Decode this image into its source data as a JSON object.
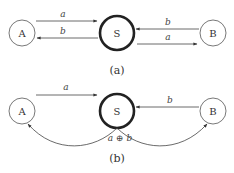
{
  "diagram": {
    "colors": {
      "stroke": "#444444",
      "hub_stroke": "#222222",
      "background": "#ffffff"
    },
    "panels": [
      {
        "caption": "(a)",
        "nodes": [
          {
            "id": "A",
            "label": "A"
          },
          {
            "id": "S",
            "label": "S",
            "emphasis": "thick-border"
          },
          {
            "id": "B",
            "label": "B"
          }
        ],
        "edges": [
          {
            "from": "A",
            "to": "S",
            "label": "a"
          },
          {
            "from": "S",
            "to": "A",
            "label": "b"
          },
          {
            "from": "B",
            "to": "S",
            "label": "b"
          },
          {
            "from": "S",
            "to": "B",
            "label": "a"
          }
        ]
      },
      {
        "caption": "(b)",
        "nodes": [
          {
            "id": "A",
            "label": "A"
          },
          {
            "id": "S",
            "label": "S",
            "emphasis": "thick-border"
          },
          {
            "id": "B",
            "label": "B"
          }
        ],
        "edges": [
          {
            "from": "A",
            "to": "S",
            "label": "a"
          },
          {
            "from": "B",
            "to": "S",
            "label": "b"
          },
          {
            "from": "S",
            "to": "A",
            "label": "a ⊕ b",
            "style": "curved"
          },
          {
            "from": "S",
            "to": "B",
            "label": "a ⊕ b",
            "style": "curved"
          }
        ]
      }
    ]
  }
}
